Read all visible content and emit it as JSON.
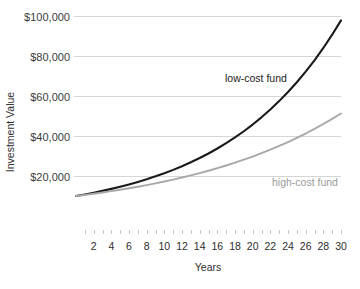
{
  "chart_data": {
    "type": "line",
    "title": "",
    "xlabel": "Years",
    "ylabel": "Investment Value",
    "xlim": [
      0,
      30
    ],
    "ylim": [
      0,
      100000
    ],
    "grid": true,
    "legend_position": "inline-annotation",
    "x": [
      0,
      1,
      2,
      3,
      4,
      5,
      6,
      7,
      8,
      9,
      10,
      11,
      12,
      13,
      14,
      15,
      16,
      17,
      18,
      19,
      20,
      21,
      22,
      23,
      24,
      25,
      26,
      27,
      28,
      29,
      30
    ],
    "x_tick_labels": [
      "2",
      "4",
      "6",
      "8",
      "10",
      "12",
      "14",
      "16",
      "18",
      "20",
      "22",
      "24",
      "26",
      "28",
      "30"
    ],
    "x_tick_values": [
      2,
      4,
      6,
      8,
      10,
      12,
      14,
      16,
      18,
      20,
      22,
      24,
      26,
      28,
      30
    ],
    "y_tick_labels": [
      "$20,000",
      "$40,000",
      "$60,000",
      "$80,000",
      "$100,000"
    ],
    "y_tick_values": [
      20000,
      40000,
      60000,
      80000,
      100000
    ],
    "series": [
      {
        "name": "low-cost fund",
        "color": "#1a1a1a",
        "annotation": "low-cost fund",
        "values": [
          10000,
          10790,
          11642,
          12561,
          13553,
          14623,
          15777,
          17023,
          18367,
          19818,
          21383,
          23072,
          24894,
          26860,
          28981,
          31270,
          33739,
          36403,
          39278,
          42380,
          45728,
          49340,
          53238,
          57444,
          61982,
          66878,
          72162,
          77863,
          84014,
          90651,
          97813
        ]
      },
      {
        "name": "high-cost fund",
        "color": "#a8a8a8",
        "annotation": "high-cost fund",
        "values": [
          10000,
          10560,
          11151,
          11775,
          12435,
          13131,
          13866,
          14643,
          15463,
          16329,
          17244,
          18209,
          19229,
          20306,
          21443,
          22644,
          23912,
          25251,
          26665,
          28158,
          29735,
          31401,
          33159,
          35016,
          36977,
          39048,
          41235,
          43544,
          45983,
          48558,
          51278
        ]
      }
    ]
  },
  "plot_geometry": {
    "left": 76,
    "right": 341,
    "top": 16,
    "bottom": 216,
    "axis_tick_y": 234,
    "xlabel_y": 250,
    "axis_title_y": 271
  },
  "annotations": {
    "low_cost_label_x": 225,
    "low_cost_label_y": 82,
    "high_cost_label_x": 272,
    "high_cost_label_y": 186
  },
  "colors": {
    "low_cost": "#1a1a1a",
    "high_cost": "#a8a8a8",
    "gridline": "#d5d5d5",
    "text": "#2e2e2e",
    "background": "#ffffff"
  }
}
